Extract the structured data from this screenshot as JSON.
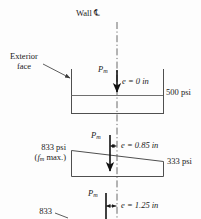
{
  "figure": {
    "title_label": "Wall",
    "centerline_symbol": "℄",
    "exterior_face_label_line1": "Exterior",
    "exterior_face_label_line2": "face"
  },
  "sections": [
    {
      "id": "section-uniform",
      "load_symbol": "P",
      "load_subscript": "m",
      "eccentricity_label": "e = 0 in",
      "eccentricity_value": 0,
      "eccentricity_units": "in",
      "left_stress_label": "",
      "right_stress_label": "500 psi",
      "left_stress_value": 500,
      "right_stress_value": 500,
      "stress_units": "psi",
      "shape": "rectangle"
    },
    {
      "id": "section-eccentric-085",
      "load_symbol": "P",
      "load_subscript": "m",
      "eccentricity_label": "e = 0.85 in",
      "eccentricity_value": 0.85,
      "eccentricity_units": "in",
      "left_stress_label": "833 psi",
      "left_stress_note_open": "(",
      "left_stress_note_symbol": "f",
      "left_stress_note_subscript": "m",
      "left_stress_note_text": " max.)",
      "right_stress_label": "333 psi",
      "left_stress_value": 833,
      "right_stress_value": 333,
      "stress_units": "psi",
      "shape": "trapezoid"
    },
    {
      "id": "section-eccentric-125",
      "load_symbol": "P",
      "load_subscript": "m",
      "eccentricity_label": "e = 1.25 in",
      "eccentricity_value": 1.25,
      "eccentricity_units": "in",
      "left_stress_label": "833",
      "left_stress_value": 833,
      "right_stress_label": "",
      "stress_units": "psi",
      "shape": "triangle"
    }
  ],
  "colors": {
    "ink": "#1a1a1a",
    "line": "#5a5a5a",
    "arrow": "#111111",
    "background": "#fdfdfd"
  }
}
